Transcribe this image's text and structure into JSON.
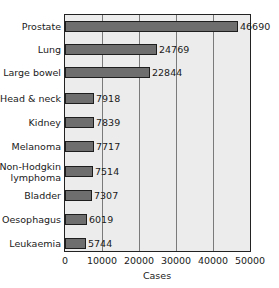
{
  "chart_data": {
    "type": "bar",
    "orientation": "horizontal",
    "title": "",
    "xlabel": "Cases",
    "ylabel": "",
    "xlim": [
      0,
      50000
    ],
    "xticks": [
      0,
      10000,
      20000,
      30000,
      40000,
      50000
    ],
    "xtick_labels": [
      "0",
      "10000",
      "20000",
      "30000",
      "40000",
      "50000"
    ],
    "grid": "vertical",
    "legend": null,
    "categories": [
      "Prostate",
      "Lung",
      "Large bowel",
      "Head & neck",
      "Kidney",
      "Melanoma",
      "Non-Hodgkin lymphoma",
      "Bladder",
      "Oesophagus",
      "Leukaemia"
    ],
    "category_lines": [
      [
        "Prostate"
      ],
      [
        "Lung"
      ],
      [
        "Large bowel"
      ],
      [
        "Head & neck"
      ],
      [
        "Kidney"
      ],
      [
        "Melanoma"
      ],
      [
        "Non-Hodgkin",
        "lymphoma"
      ],
      [
        "Bladder"
      ],
      [
        "Oesophagus"
      ],
      [
        "Leukaemia"
      ]
    ],
    "values": [
      46690,
      24769,
      22844,
      7918,
      7839,
      7717,
      7514,
      7307,
      6019,
      5744
    ],
    "value_labels": [
      "46690",
      "24769",
      "22844",
      "7918",
      "7839",
      "7717",
      "7514",
      "7307",
      "6019",
      "5744"
    ],
    "colors": {
      "bar": "#6e6e6e",
      "bar_border": "#1e1e1e",
      "plot_bg": "#ececec",
      "grid": "#7a7a7a"
    }
  }
}
